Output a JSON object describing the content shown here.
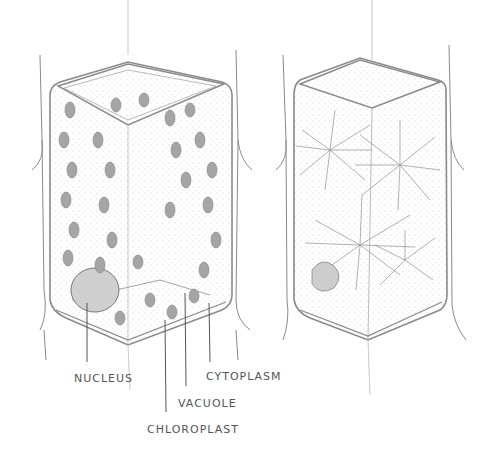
{
  "diagram": {
    "type": "labeled pencil illustration",
    "panels": [
      {
        "id": "left-cell",
        "description": "Plant cell with chloroplasts along cytoplasm, large central vacuole, nucleus at lower left"
      },
      {
        "id": "right-cell",
        "description": "Plant cell with radiating crystal/strand structures (raphides) inside"
      }
    ],
    "labels": {
      "nucleus": "NUCLEUS",
      "cytoplasm": "CYTOPLASM",
      "vacuole": "VACUOLE",
      "chloroplast": "CHLOROPLAST"
    },
    "colors": {
      "ink": "#555555",
      "wall": "#8a8a8a",
      "chloroplast": "#9a9a9a",
      "background": "#ffffff"
    }
  }
}
